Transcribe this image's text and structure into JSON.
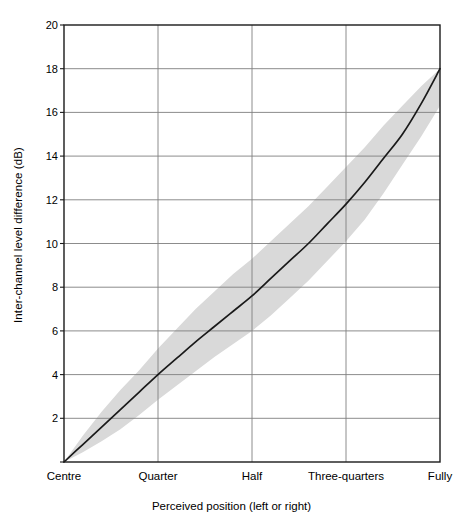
{
  "chart_data": {
    "type": "line",
    "title": "",
    "subtitle": "",
    "xlabel": "Perceived position (left or right)",
    "ylabel": "Inter-channel level difference (dB)",
    "ylim": [
      0,
      20
    ],
    "xlim": [
      0,
      1
    ],
    "grid": true,
    "legend": "none",
    "y_ticks": [
      0,
      2,
      4,
      6,
      8,
      10,
      12,
      14,
      16,
      18,
      20
    ],
    "y_tick_labels": [
      "",
      "2",
      "4",
      "6",
      "8",
      "10",
      "12",
      "14",
      "16",
      "18",
      "20"
    ],
    "x_categories": [
      "Centre",
      "Quarter",
      "Half",
      "Three-quarters",
      "Fully"
    ],
    "x_positions": [
      0,
      0.25,
      0.5,
      0.75,
      1.0
    ],
    "series": [
      {
        "name": "Mean inter-channel level difference",
        "x": [
          0,
          0.05,
          0.1,
          0.15,
          0.2,
          0.25,
          0.3,
          0.35,
          0.4,
          0.45,
          0.5,
          0.55,
          0.6,
          0.65,
          0.7,
          0.75,
          0.8,
          0.85,
          0.9,
          0.95,
          1.0
        ],
        "values": [
          0,
          0.8,
          1.6,
          2.4,
          3.2,
          4.0,
          4.75,
          5.5,
          6.2,
          6.9,
          7.6,
          8.4,
          9.2,
          10.0,
          10.9,
          11.8,
          12.8,
          13.9,
          15.0,
          16.4,
          18.0
        ]
      }
    ],
    "band": {
      "name": "Spread of responses",
      "x": [
        0,
        0.05,
        0.1,
        0.15,
        0.2,
        0.25,
        0.3,
        0.35,
        0.4,
        0.45,
        0.5,
        0.55,
        0.6,
        0.65,
        0.7,
        0.75,
        0.8,
        0.85,
        0.9,
        0.95,
        1.0
      ],
      "upper": [
        0,
        1.2,
        2.3,
        3.3,
        4.2,
        5.2,
        6.1,
        7.0,
        7.8,
        8.6,
        9.3,
        10.1,
        10.9,
        11.7,
        12.6,
        13.5,
        14.4,
        15.4,
        16.3,
        17.2,
        18.0
      ],
      "lower": [
        0,
        0.45,
        0.95,
        1.5,
        2.15,
        2.85,
        3.5,
        4.15,
        4.8,
        5.4,
        6.0,
        6.7,
        7.5,
        8.3,
        9.2,
        10.1,
        11.1,
        12.3,
        13.6,
        14.9,
        16.3
      ]
    },
    "colors": {
      "line": "#1a1a1a",
      "band": "#d9d9d9",
      "grid": "#7f7f7f",
      "axis": "#1a1a1a",
      "background": "#ffffff"
    },
    "geometry": {
      "plot_left": 64,
      "plot_right": 440,
      "plot_top": 25,
      "plot_bottom": 462
    }
  }
}
